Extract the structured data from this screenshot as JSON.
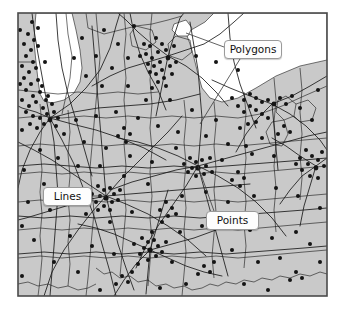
{
  "figure": {
    "kind": "gis-vector-data-map",
    "region": "Great Lakes / Midwest United States",
    "frame": {
      "x": 18,
      "y": 13,
      "width": 309,
      "height": 283
    },
    "colors": {
      "page_background": "#ffffff",
      "land_fill": "#c9c9c9",
      "water_fill": "#ffffff",
      "line_stroke": "#1a1a1a",
      "point_fill": "#141414",
      "frame_stroke": "#4a4a4a",
      "callout_fill": "#fdfdfd",
      "callout_border": "#9a9a9a",
      "callout_text": "#111111",
      "leader_stroke": "#3a3a3a"
    }
  },
  "callouts": [
    {
      "id": "polygons",
      "label": "Polygons",
      "box": {
        "x": 224,
        "y": 40,
        "width": 58,
        "height": 19
      },
      "leaders": [
        {
          "from": [
            224,
            47
          ],
          "to": [
            186,
            33
          ]
        },
        {
          "from": [
            240,
            59
          ],
          "to": [
            200,
            124
          ]
        }
      ]
    },
    {
      "id": "lines",
      "label": "Lines",
      "box": {
        "x": 43,
        "y": 187,
        "width": 49,
        "height": 19
      },
      "leaders": [
        {
          "from": [
            92,
            196
          ],
          "to": [
            106,
            196
          ]
        }
      ]
    },
    {
      "id": "points",
      "label": "Points",
      "box": {
        "x": 206,
        "y": 211,
        "width": 53,
        "height": 19
      },
      "leaders": [
        {
          "from": [
            214,
            211
          ],
          "to": [
            198,
            166
          ]
        }
      ]
    }
  ],
  "legend_meaning": {
    "polygons": "County and state boundary areas (filled regions)",
    "lines": "Road / highway network linework",
    "points": "City and place location markers"
  },
  "water_bodies": [
    {
      "name": "Lake Michigan (southern tip)",
      "position": "top-left"
    },
    {
      "name": "Lake Erie / Lake St. Clair",
      "position": "top-right"
    }
  ],
  "point_clusters": [
    {
      "name": "Chicago",
      "position": "left edge, upper"
    },
    {
      "name": "Detroit",
      "position": "upper center-right"
    },
    {
      "name": "Cleveland",
      "position": "right, upper"
    },
    {
      "name": "Indianapolis",
      "position": "center-left, lower"
    },
    {
      "name": "Columbus",
      "position": "center"
    },
    {
      "name": "Cincinnati",
      "position": "lower center"
    },
    {
      "name": "Pittsburgh",
      "position": "right edge"
    }
  ]
}
